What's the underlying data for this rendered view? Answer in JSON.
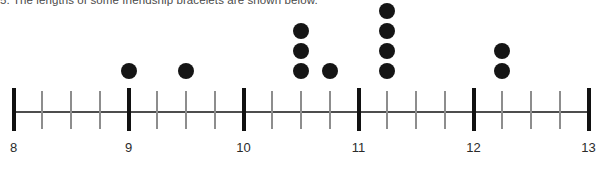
{
  "prompt": {
    "text": "5. The lengths of some friendship bracelets are shown below."
  },
  "colors": {
    "dot": "#151515",
    "axis": "#4d4d4d",
    "tick_major": "#111111",
    "tick_minor": "#8d8d8d",
    "label": "#2b2b2b",
    "background": "#ffffff"
  },
  "chart_data": {
    "type": "scatter",
    "plot_style": "dot-plot",
    "title": "",
    "xlabel": "",
    "ylabel": "",
    "grid": false,
    "legend": null,
    "xlim": [
      8,
      13
    ],
    "x_major_step": 1,
    "x_minor_step": 0.25,
    "major_tick_labels": [
      "8",
      "9",
      "10",
      "11",
      "12",
      "13"
    ],
    "major_tick_values": [
      8,
      9,
      10,
      11,
      12,
      13
    ],
    "minor_tick_values": [
      8.25,
      8.5,
      8.75,
      9.25,
      9.5,
      9.75,
      10.25,
      10.5,
      10.75,
      11.25,
      11.5,
      11.75,
      12.25,
      12.5,
      12.75
    ],
    "x": [
      9,
      9.5,
      10.5,
      10.75,
      11.25,
      12.25
    ],
    "counts": [
      1,
      1,
      3,
      1,
      4,
      2
    ],
    "points": [
      {
        "value": 9,
        "count": 1
      },
      {
        "value": 9.5,
        "count": 1
      },
      {
        "value": 10.5,
        "count": 3
      },
      {
        "value": 10.75,
        "count": 1
      },
      {
        "value": 11.25,
        "count": 4
      },
      {
        "value": 12.25,
        "count": 2
      }
    ],
    "total_observations": 12,
    "ymax_stack": 4
  }
}
